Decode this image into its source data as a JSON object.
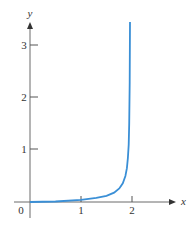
{
  "chart_data": {
    "type": "line",
    "title": "",
    "xlabel": "x",
    "ylabel": "y",
    "xlim": [
      0,
      2.6
    ],
    "ylim": [
      0,
      3.5
    ],
    "grid": false,
    "x_ticks": [
      "0",
      "1",
      "2"
    ],
    "y_ticks": [
      "1",
      "2",
      "3"
    ],
    "series": [
      {
        "name": "curve",
        "color": "#3a8fd6",
        "x": [
          0,
          0.5,
          1.0,
          1.3,
          1.5,
          1.65,
          1.75,
          1.82,
          1.87,
          1.9,
          1.92,
          1.935,
          1.945,
          1.955,
          1.96
        ],
        "y": [
          0.0,
          0.01,
          0.04,
          0.08,
          0.12,
          0.18,
          0.26,
          0.36,
          0.5,
          0.65,
          0.85,
          1.1,
          1.5,
          2.3,
          3.46
        ]
      }
    ]
  },
  "labels": {
    "origin": "0",
    "x1": "1",
    "x2": "2",
    "y1": "1",
    "y2": "2",
    "y3": "3",
    "x_axis": "x",
    "y_axis": "y"
  },
  "colors": {
    "axis": "#555555",
    "curve": "#3a8fd6"
  }
}
